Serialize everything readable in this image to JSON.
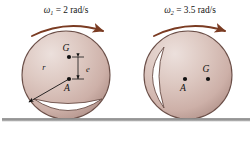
{
  "figure": {
    "background_color": "#ffffff",
    "ground": {
      "name": "ground-line",
      "color": "#8c8c8c",
      "highlight_color": "#c9c9c9",
      "y": 119,
      "x_start": 2,
      "x_end": 250
    },
    "colors": {
      "body_light": "#e8d6d2",
      "body_mid": "#d6bdb6",
      "body_dark": "#b89a92",
      "outline": "#6b4f48",
      "cutout_fill": "#ffffff",
      "arrow": "#7a3b22",
      "text": "#141414"
    },
    "wheels": [
      {
        "id": "left-wheel",
        "omega_symbol": "ω",
        "omega_subscript": "1",
        "omega_equals": "= 2 rad/s",
        "omega_full": "ω₁ = 2 rad/s",
        "center_x": 66,
        "center_y": 75,
        "radius": 44,
        "rotation_direction": "clockwise",
        "points": [
          {
            "name": "G",
            "label": "G",
            "cx": 69,
            "cy": 57,
            "label_dx": -3,
            "label_dy": -6
          },
          {
            "name": "A",
            "label": "A",
            "cx": 69,
            "cy": 79,
            "label_dx": -2,
            "label_dy": 12
          }
        ],
        "dimension": {
          "label": "e",
          "label_x": 86,
          "label_y": 72,
          "arrow_x": 78,
          "arrow_top": 57,
          "arrow_bottom": 79
        },
        "radius_line": {
          "label": "r",
          "label_x": 44,
          "label_y": 70,
          "from_x": 69,
          "from_y": 79,
          "to_x": 29,
          "to_y": 102
        },
        "cutout": {
          "name": "crescent-cutout",
          "orientation": "bottom",
          "chord_x1": 34,
          "chord_x2": 102,
          "chord_y": 99,
          "bulge": 15
        }
      },
      {
        "id": "right-wheel",
        "omega_symbol": "ω",
        "omega_subscript": "2",
        "omega_equals": "= 3.5 rad/s",
        "omega_full": "ω₂ = 3.5 rad/s",
        "center_x": 188,
        "center_y": 75,
        "radius": 44,
        "rotation_direction": "clockwise",
        "points": [
          {
            "name": "A",
            "label": "A",
            "cx": 185,
            "cy": 79,
            "label_dx": -2,
            "label_dy": 12
          },
          {
            "name": "G",
            "label": "G",
            "cx": 208,
            "cy": 79,
            "label_dx": -3,
            "label_dy": -6
          }
        ],
        "cutout": {
          "name": "crescent-cutout",
          "orientation": "left",
          "chord_y1": 47,
          "chord_y2": 108,
          "chord_x": 164,
          "bulge": 15
        }
      }
    ],
    "arrows": [
      {
        "name": "omega-arc-left",
        "start_x": 32,
        "start_y": 36,
        "end_x": 103,
        "end_y": 31,
        "peak_y": 22,
        "label_x": 66,
        "label_y": 12
      },
      {
        "name": "omega-arc-right",
        "start_x": 154,
        "start_y": 36,
        "end_x": 225,
        "end_y": 31,
        "peak_y": 22,
        "label_x": 190,
        "label_y": 12
      }
    ]
  }
}
